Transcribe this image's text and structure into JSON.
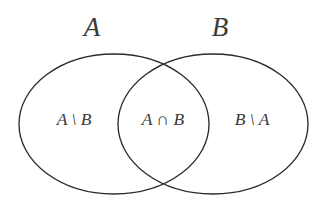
{
  "figure": {
    "type": "venn-diagram-2-set",
    "background_color": "#ffffff",
    "stroke_color": "#2b2b2b",
    "text_color": "#3a3a3a"
  },
  "sets": {
    "left": {
      "title": "A",
      "title_x": 92,
      "title_y": 30,
      "center_x": 114,
      "center_y": 124,
      "radius_x": 95,
      "radius_y": 70
    },
    "right": {
      "title": "B",
      "title_x": 220,
      "title_y": 30,
      "center_x": 213,
      "center_y": 124,
      "radius_x": 95,
      "radius_y": 70
    }
  },
  "regions": [
    {
      "name": "left-only",
      "label": "A \\ B",
      "x": 74,
      "y": 121
    },
    {
      "name": "intersection",
      "label": "A ∩ B",
      "x": 163,
      "y": 121
    },
    {
      "name": "right-only",
      "label": "B \\ A",
      "x": 252,
      "y": 121
    }
  ]
}
